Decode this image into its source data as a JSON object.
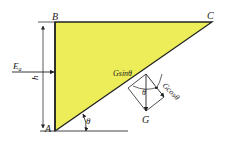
{
  "diagram": {
    "type": "retaining-wall soil wedge force diagram",
    "colors": {
      "wedge_fill": "#eded5a",
      "line": "#222222",
      "background": "#ffffff"
    },
    "points": {
      "A": "A",
      "B": "B",
      "C": "C",
      "G": "G"
    },
    "labels": {
      "earth_pressure": "E",
      "earth_pressure_sub": "a",
      "height": "h",
      "angle_base": "θ",
      "angle_force": "θ",
      "g_sin": "Gsinθ",
      "g_cos": "Gcosθ"
    }
  }
}
